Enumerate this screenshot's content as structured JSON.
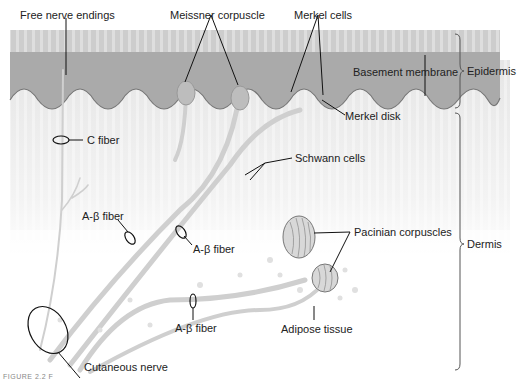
{
  "figure": {
    "caption_fragment": "FIGURE 2.2 F",
    "labels": {
      "free_nerve_endings": "Free nerve endings",
      "meissner_corpuscle": "Meissner corpuscle",
      "merkel_cells": "Merkel cells",
      "basement_membrane": "Basement membrane",
      "merkel_disk": "Merkel disk",
      "c_fiber": "C fiber",
      "schwann_cells": "Schwann cells",
      "a_beta_fiber_1": "A-β fiber",
      "a_beta_fiber_2": "A-β fiber",
      "a_beta_fiber_3": "A-β fiber",
      "pacinian_corpuscles": "Pacinian corpuscles",
      "adipose_tissue": "Adipose tissue",
      "cutaneous_nerve": "Cutaneous nerve"
    },
    "layers": {
      "epidermis": "Epidermis",
      "dermis": "Dermis"
    },
    "colors": {
      "epidermis_top": "#c8c8c8",
      "epidermis_dark": "#a9a9a9",
      "dermis_stripe": "#e4e4e4",
      "fiber": "#c9c9c9",
      "line": "#222222"
    }
  }
}
